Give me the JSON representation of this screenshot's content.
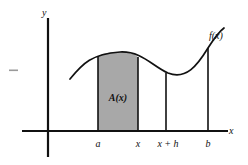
{
  "figure": {
    "background_color": "#ffffff",
    "ink_color": "#111111",
    "shaded_region_color": "#a8a8a8",
    "axes": {
      "y_axis_label": "y",
      "x_axis_label": "x",
      "y_axis_x_px": 48,
      "x_axis_y_px": 131
    },
    "curve": {
      "label": "f(x)",
      "stroke_color": "#111111",
      "path": "M 70,79 C 83,63 92,54 120,52 C 142,51 152,66 168,73 C 186,80 197,66 208,48 C 215,37 220,31 224,28"
    },
    "shaded_area": {
      "label": "A(x)",
      "from_tick": "a",
      "to_tick": "x",
      "fill": "#a8a8a8",
      "path": "M 98,56 C 103,53 110,52 120,52 C 130,52 134,54 138,57 L 138,131 L 98,131 Z"
    },
    "vertical_lines": [
      {
        "name": "ordinate-at-a",
        "x_px": 98,
        "top_y_px": 56,
        "bottom_y_px": 131
      },
      {
        "name": "ordinate-at-x",
        "x_px": 138,
        "top_y_px": 57,
        "bottom_y_px": 131
      },
      {
        "name": "ordinate-at-x-plus-h",
        "x_px": 166,
        "top_y_px": 73,
        "bottom_y_px": 131
      },
      {
        "name": "ordinate-at-b",
        "x_px": 208,
        "top_y_px": 48,
        "bottom_y_px": 131
      }
    ],
    "x_ticks": [
      {
        "label": "a",
        "x_px": 98
      },
      {
        "label": "x",
        "x_px": 138
      },
      {
        "label": "x + h",
        "x_px": 168
      },
      {
        "label": "b",
        "x_px": 208
      }
    ],
    "margin_mark": {
      "name": "margin-dash",
      "x_px": 9,
      "y_px": 70,
      "width_px": 9
    }
  }
}
